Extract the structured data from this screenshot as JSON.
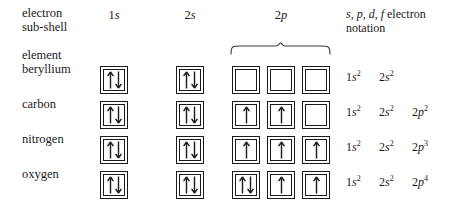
{
  "headers": {
    "subshell_label": "electron\nsub-shell",
    "element_label": "element",
    "notation_label_prefix": "s, p, d, f",
    "notation_label_suffix": " electron notation",
    "columns": [
      {
        "name": "1s",
        "lead": "1",
        "orbital": "s",
        "x": 114
      },
      {
        "name": "2s",
        "lead": "2",
        "orbital": "s",
        "x": 190
      },
      {
        "name": "2p",
        "lead": "2",
        "orbital": "p",
        "x": 281
      }
    ]
  },
  "geometry": {
    "box_x": {
      "s1": 100,
      "s2": 176,
      "p1": 232,
      "p2": 267,
      "p3": 302
    },
    "row_y": [
      66,
      101,
      136,
      171
    ],
    "label_y": [
      62,
      97,
      132,
      167
    ],
    "notation_y": [
      70,
      105,
      140,
      175
    ]
  },
  "rows": [
    {
      "element": "beryllium",
      "orbitals": {
        "1s": "pair",
        "2s": "pair",
        "2p": [
          "empty",
          "empty",
          "empty"
        ]
      },
      "notation": [
        {
          "n": "1",
          "l": "s",
          "count": "2"
        },
        {
          "n": "2",
          "l": "s",
          "count": "2"
        }
      ]
    },
    {
      "element": "carbon",
      "orbitals": {
        "1s": "pair",
        "2s": "pair",
        "2p": [
          "up",
          "up",
          "empty"
        ]
      },
      "notation": [
        {
          "n": "1",
          "l": "s",
          "count": "2"
        },
        {
          "n": "2",
          "l": "s",
          "count": "2"
        },
        {
          "n": "2",
          "l": "p",
          "count": "2"
        }
      ]
    },
    {
      "element": "nitrogen",
      "orbitals": {
        "1s": "pair",
        "2s": "pair",
        "2p": [
          "up",
          "up",
          "up"
        ]
      },
      "notation": [
        {
          "n": "1",
          "l": "s",
          "count": "2"
        },
        {
          "n": "2",
          "l": "s",
          "count": "2"
        },
        {
          "n": "2",
          "l": "p",
          "count": "3"
        }
      ]
    },
    {
      "element": "oxygen",
      "orbitals": {
        "1s": "pair",
        "2s": "pair",
        "2p": [
          "pair",
          "up",
          "up"
        ]
      },
      "notation": [
        {
          "n": "1",
          "l": "s",
          "count": "2"
        },
        {
          "n": "2",
          "l": "s",
          "count": "2"
        },
        {
          "n": "2",
          "l": "p",
          "count": "4"
        }
      ]
    }
  ],
  "colors": {
    "ink": "#1a1a1a",
    "background": "#ffffff"
  }
}
